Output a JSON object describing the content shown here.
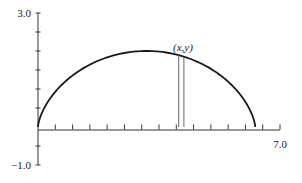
{
  "chart_data": {
    "type": "line",
    "title": "",
    "xlabel": "",
    "ylabel": "",
    "xlim": [
      0,
      7.0
    ],
    "ylim": [
      -1.0,
      3.0
    ],
    "x_tick_step": 0.5,
    "y_tick_step": 0.5,
    "x_tick_labels": [
      "7.0"
    ],
    "y_tick_labels": [
      "3.0",
      "-1.0"
    ],
    "grid": false,
    "legend": null,
    "series": [
      {
        "name": "cycloid",
        "parametric": {
          "x": "t - sin(t)",
          "y": "1 - cos(t)",
          "t_range": [
            0,
            6.2832
          ]
        },
        "key_points": [
          [
            0,
            0
          ],
          [
            3.14,
            2.0
          ],
          [
            6.28,
            0
          ]
        ]
      }
    ],
    "annotations": [
      {
        "text": "(x,y)",
        "x": 4.2,
        "y": 2.05
      },
      {
        "type": "rectangle-strip",
        "x_left": 4.07,
        "x_right": 4.22,
        "y_bottom": 0
      }
    ]
  },
  "labels": {
    "y_top": "3.0",
    "y_bottom": "−1.0",
    "x_right": "7.0",
    "point": "(x,y)"
  },
  "colors": {
    "curve": "#1a1a1a",
    "axis": "#333333",
    "strip": "#555555"
  }
}
